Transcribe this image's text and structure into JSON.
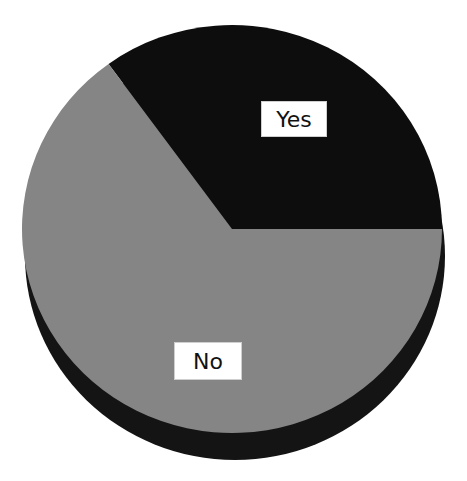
{
  "chart_data": {
    "type": "pie",
    "title": "",
    "style": "3d",
    "categories": [
      "Yes",
      "No"
    ],
    "values": [
      35,
      65
    ],
    "colors": [
      "#0d0d0d",
      "#858585"
    ],
    "start_angle_deg": 0,
    "direction": "counterclockwise",
    "legend": "none",
    "labels": [
      {
        "text": "Yes",
        "box": [
          261,
          101,
          66,
          36
        ]
      },
      {
        "text": "No",
        "box": [
          174,
          342,
          68,
          38
        ]
      }
    ]
  },
  "geometry": {
    "cx": 232,
    "cy": 229,
    "rx": 210,
    "ry": 204,
    "depth_dx": 3,
    "depth_dy": 27,
    "side_color": "#141414"
  }
}
